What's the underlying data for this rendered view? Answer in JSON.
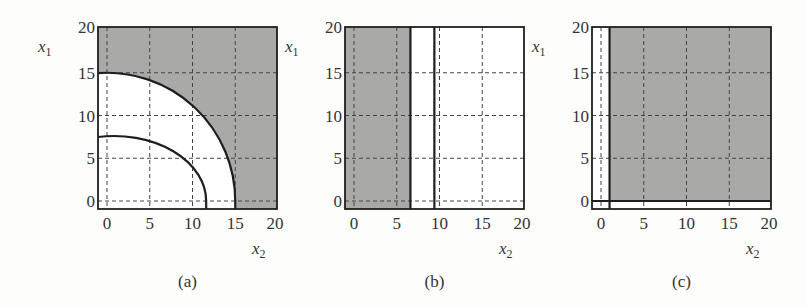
{
  "chart_data": [
    {
      "type": "region",
      "caption": "(a)",
      "xlabel": "x2",
      "ylabel": "x1",
      "xlim": [
        0,
        20
      ],
      "ylim": [
        0,
        20
      ],
      "xticks": [
        0,
        5,
        10,
        15,
        20
      ],
      "yticks": [
        0,
        5,
        10,
        15,
        20
      ],
      "grid": true,
      "shaded_region": "outside circle of radius 15 (x1^2 + x2^2 >= 225)",
      "boundaries": [
        {
          "kind": "arc",
          "radius_x": 15,
          "radius_y": 15,
          "center": [
            0,
            0
          ]
        },
        {
          "kind": "arc",
          "radius_x": 10.8,
          "radius_y": 7.6,
          "center": [
            0.8,
            0
          ]
        }
      ]
    },
    {
      "type": "region",
      "caption": "(b)",
      "xlabel": "x2",
      "ylabel": "x1",
      "xlim": [
        0,
        20
      ],
      "ylim": [
        0,
        20
      ],
      "xticks": [
        0,
        5,
        10,
        15,
        20
      ],
      "yticks": [
        0,
        5,
        10,
        15,
        20
      ],
      "grid": true,
      "shaded_region": "x2 <= 6.6",
      "boundaries": [
        {
          "kind": "vline",
          "x": 6.6
        },
        {
          "kind": "vline",
          "x": 9.4
        }
      ]
    },
    {
      "type": "region",
      "caption": "(c)",
      "xlabel": "x2",
      "ylabel": "x1",
      "xlim": [
        0,
        20
      ],
      "ylim": [
        0,
        20
      ],
      "xticks": [
        0,
        5,
        10,
        15,
        20
      ],
      "yticks": [
        0,
        5,
        10,
        15,
        20
      ],
      "grid": true,
      "shaded_region": "x2 >= 1 and x1 >= 0",
      "boundaries": [
        {
          "kind": "vline",
          "x": 1
        },
        {
          "kind": "hline",
          "y": 0
        }
      ]
    }
  ],
  "colors": {
    "shade": "#a9a9a7",
    "line": "#1e1e1e",
    "grid": "#444444",
    "background": "#fdfdfb"
  },
  "panels": [
    {
      "caption": "(a)",
      "ylabel_main": "x",
      "ylabel_sub": "1",
      "xlabel_main": "x",
      "xlabel_sub": "2"
    },
    {
      "caption": "(b)",
      "ylabel_main": "x",
      "ylabel_sub": "1",
      "xlabel_main": "x",
      "xlabel_sub": "2"
    },
    {
      "caption": "(c)",
      "ylabel_main": "x",
      "ylabel_sub": "1",
      "xlabel_main": "x",
      "xlabel_sub": "2"
    }
  ]
}
